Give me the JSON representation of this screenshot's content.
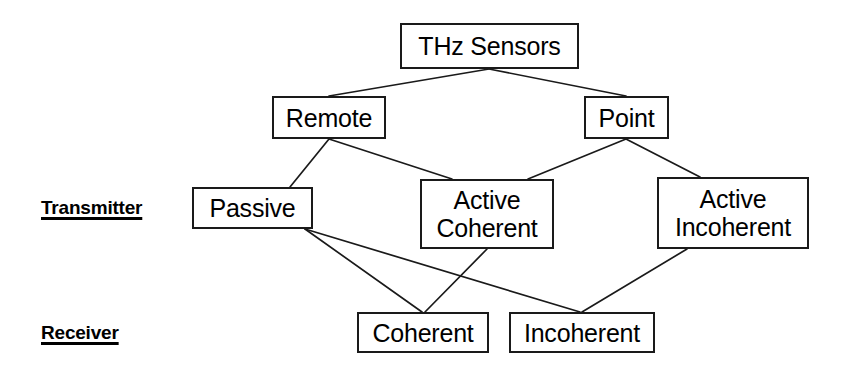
{
  "diagram": {
    "line_color": "#1a1a1a",
    "box_border_color": "#1a1a1a",
    "background_color": "#ffffff",
    "text_color": "#000000",
    "row_labels": [
      {
        "id": "transmitter",
        "text": "Transmitter"
      },
      {
        "id": "receiver",
        "text": "Receiver"
      }
    ],
    "nodes": [
      {
        "id": "thz-sensors",
        "label": "THz Sensors",
        "line1": "THz Sensors",
        "line2": ""
      },
      {
        "id": "remote",
        "label": "Remote",
        "line1": "Remote",
        "line2": ""
      },
      {
        "id": "point",
        "label": "Point",
        "line1": "Point",
        "line2": ""
      },
      {
        "id": "passive",
        "label": "Passive",
        "line1": "Passive",
        "line2": ""
      },
      {
        "id": "active-coherent",
        "label": "Active Coherent",
        "line1": "Active",
        "line2": "Coherent"
      },
      {
        "id": "active-incoherent",
        "label": "Active Incoherent",
        "line1": "Active",
        "line2": "Incoherent"
      },
      {
        "id": "coherent",
        "label": "Coherent",
        "line1": "Coherent",
        "line2": ""
      },
      {
        "id": "incoherent",
        "label": "Incoherent",
        "line1": "Incoherent",
        "line2": ""
      }
    ],
    "edges": [
      {
        "from": "thz-sensors",
        "to": "remote"
      },
      {
        "from": "thz-sensors",
        "to": "point"
      },
      {
        "from": "remote",
        "to": "passive"
      },
      {
        "from": "remote",
        "to": "active-coherent"
      },
      {
        "from": "point",
        "to": "active-coherent"
      },
      {
        "from": "point",
        "to": "active-incoherent"
      },
      {
        "from": "passive",
        "to": "coherent"
      },
      {
        "from": "passive",
        "to": "incoherent"
      },
      {
        "from": "active-coherent",
        "to": "coherent"
      },
      {
        "from": "active-incoherent",
        "to": "incoherent"
      }
    ]
  }
}
